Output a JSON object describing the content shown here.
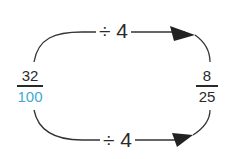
{
  "diagram": {
    "left_fraction": {
      "numerator": "32",
      "denominator": "100",
      "denominator_color": "#3fa9d6"
    },
    "right_fraction": {
      "numerator": "8",
      "denominator": "25"
    },
    "top_operation": "÷ 4",
    "bottom_operation": "÷ 4",
    "line_color": "#2a2a2a"
  }
}
